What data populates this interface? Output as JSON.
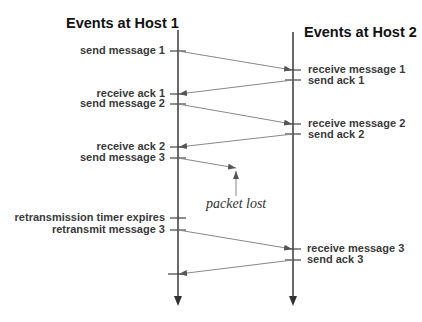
{
  "hosts": [
    {
      "title": "Events at Host 1"
    },
    {
      "title": "Events at Host 2"
    }
  ],
  "host1_events": [
    {
      "label": "send message 1"
    },
    {
      "label": "receive ack 1"
    },
    {
      "label": "send message 2"
    },
    {
      "label": "receive ack 2"
    },
    {
      "label": "send message 3"
    },
    {
      "label": "retransmission timer expires"
    },
    {
      "label": "retransmit message 3"
    }
  ],
  "host2_events": [
    {
      "label": "receive message 1"
    },
    {
      "label": "send ack 1"
    },
    {
      "label": "receive message 2"
    },
    {
      "label": "send ack 2"
    },
    {
      "label": "receive message 3"
    },
    {
      "label": "send ack 3"
    }
  ],
  "annotation": {
    "label": "packet lost"
  },
  "colors": {
    "line": "#444444",
    "arrow": "#888888",
    "text": "#3a3a3a"
  }
}
